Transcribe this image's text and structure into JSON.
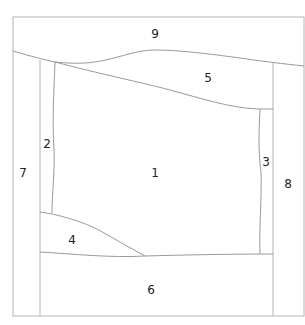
{
  "diagram": {
    "type": "region-map",
    "regions": [
      {
        "id": "1",
        "label": "1",
        "x": 155,
        "y": 173
      },
      {
        "id": "2",
        "label": "2",
        "x": 47,
        "y": 144
      },
      {
        "id": "3",
        "label": "3",
        "x": 266,
        "y": 162
      },
      {
        "id": "4",
        "label": "4",
        "x": 72,
        "y": 240
      },
      {
        "id": "5",
        "label": "5",
        "x": 208,
        "y": 78
      },
      {
        "id": "6",
        "label": "6",
        "x": 151,
        "y": 290
      },
      {
        "id": "7",
        "label": "7",
        "x": 23,
        "y": 173
      },
      {
        "id": "8",
        "label": "8",
        "x": 288,
        "y": 184
      },
      {
        "id": "9",
        "label": "9",
        "x": 155,
        "y": 33
      }
    ],
    "colors": {
      "outline": "#b4b4b4",
      "inner_lines": "#9a9a9a",
      "label": "#222222",
      "background": "#ffffff"
    }
  }
}
